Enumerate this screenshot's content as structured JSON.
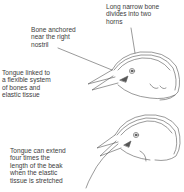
{
  "diagram": {
    "labels": {
      "long_bone": "Long narrow bone\ndivides into two\nhorns",
      "bone_anchored": "Bone anchored\nnear the right\nnostril",
      "tongue_linked": "Tongue linked to\na flexible system\nof bones and\nelastic tissue",
      "tongue_extend": "Tongue can extend\nfour times the\nlength of the beak\nwhen the elastic\ntissue is stretched"
    },
    "figures": [
      {
        "name": "bird-head-retracted",
        "state": "tongue retracted"
      },
      {
        "name": "bird-head-extended",
        "state": "tongue extended"
      }
    ],
    "colors": {
      "line": "#555555",
      "text": "#3d3d3d",
      "background": "#ffffff"
    }
  }
}
